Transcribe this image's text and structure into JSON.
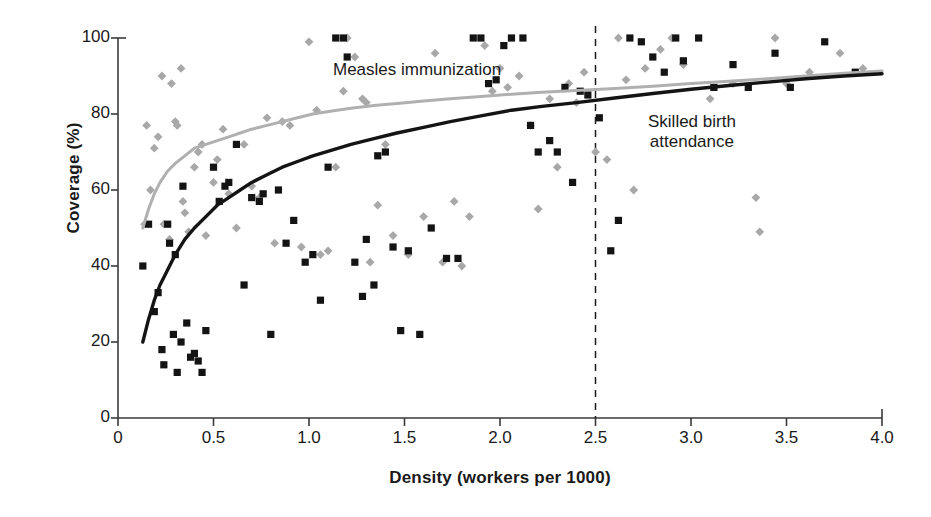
{
  "chart_data": {
    "type": "scatter",
    "title": "",
    "xlabel": "Density (workers per 1000)",
    "ylabel": "Coverage (%)",
    "xlim": [
      0,
      4.0
    ],
    "ylim": [
      0,
      100
    ],
    "xticks": [
      "0",
      "0.5",
      "1.0",
      "1.5",
      "2.0",
      "2.5",
      "3.0",
      "3.5",
      "4.0"
    ],
    "xtick_values": [
      0,
      0.5,
      1.0,
      1.5,
      2.0,
      2.5,
      3.0,
      3.5,
      4.0
    ],
    "yticks": [
      "0",
      "20",
      "40",
      "60",
      "80",
      "100"
    ],
    "ytick_values": [
      0,
      20,
      40,
      60,
      80,
      100
    ],
    "grid": false,
    "legend_position": "inline-annotations",
    "annotations": [
      {
        "text": "Measles immunization",
        "x": 1.15,
        "y": 88
      },
      {
        "text": "Skilled birth attendance",
        "x": 2.82,
        "y": 76
      }
    ],
    "reference_lines": [
      {
        "orientation": "vertical",
        "value": 2.5,
        "style": "dashed",
        "color": "#1a1a1a"
      }
    ],
    "series": [
      {
        "name": "Measles immunization",
        "marker": "diamond",
        "color": "#a8a8a8",
        "points": [
          [
            0.14,
            51
          ],
          [
            0.15,
            77
          ],
          [
            0.17,
            60
          ],
          [
            0.19,
            71
          ],
          [
            0.21,
            74
          ],
          [
            0.23,
            90
          ],
          [
            0.24,
            51
          ],
          [
            0.27,
            47
          ],
          [
            0.28,
            88
          ],
          [
            0.3,
            78
          ],
          [
            0.31,
            77
          ],
          [
            0.33,
            92
          ],
          [
            0.34,
            57
          ],
          [
            0.35,
            54
          ],
          [
            0.37,
            49
          ],
          [
            0.4,
            66
          ],
          [
            0.42,
            70
          ],
          [
            0.44,
            72
          ],
          [
            0.46,
            48
          ],
          [
            0.5,
            62
          ],
          [
            0.52,
            68
          ],
          [
            0.55,
            76
          ],
          [
            0.58,
            59
          ],
          [
            0.62,
            50
          ],
          [
            0.66,
            72
          ],
          [
            0.7,
            61
          ],
          [
            0.74,
            58
          ],
          [
            0.78,
            79
          ],
          [
            0.82,
            46
          ],
          [
            0.86,
            78
          ],
          [
            0.9,
            77
          ],
          [
            0.96,
            45
          ],
          [
            1.0,
            99
          ],
          [
            1.04,
            81
          ],
          [
            1.06,
            43
          ],
          [
            1.1,
            44
          ],
          [
            1.14,
            66
          ],
          [
            1.18,
            86
          ],
          [
            1.2,
            100
          ],
          [
            1.24,
            95
          ],
          [
            1.28,
            84
          ],
          [
            1.3,
            83
          ],
          [
            1.32,
            41
          ],
          [
            1.36,
            56
          ],
          [
            1.4,
            72
          ],
          [
            1.44,
            48
          ],
          [
            1.52,
            43
          ],
          [
            1.6,
            53
          ],
          [
            1.66,
            96
          ],
          [
            1.7,
            41
          ],
          [
            1.76,
            57
          ],
          [
            1.8,
            40
          ],
          [
            1.84,
            53
          ],
          [
            1.92,
            98
          ],
          [
            1.96,
            86
          ],
          [
            2.0,
            92
          ],
          [
            2.04,
            87
          ],
          [
            2.1,
            90
          ],
          [
            2.16,
            77
          ],
          [
            2.2,
            55
          ],
          [
            2.26,
            84
          ],
          [
            2.3,
            66
          ],
          [
            2.36,
            88
          ],
          [
            2.4,
            83
          ],
          [
            2.44,
            91
          ],
          [
            2.5,
            70
          ],
          [
            2.56,
            68
          ],
          [
            2.62,
            100
          ],
          [
            2.66,
            89
          ],
          [
            2.7,
            60
          ],
          [
            2.76,
            92
          ],
          [
            2.84,
            97
          ],
          [
            2.9,
            100
          ],
          [
            2.96,
            93
          ],
          [
            3.1,
            84
          ],
          [
            3.22,
            88
          ],
          [
            3.34,
            58
          ],
          [
            3.36,
            49
          ],
          [
            3.44,
            100
          ],
          [
            3.5,
            88
          ],
          [
            3.62,
            91
          ],
          [
            3.78,
            96
          ],
          [
            3.9,
            92
          ]
        ]
      },
      {
        "name": "Skilled birth attendance",
        "marker": "square",
        "color": "#141414",
        "points": [
          [
            0.13,
            40
          ],
          [
            0.16,
            51
          ],
          [
            0.19,
            28
          ],
          [
            0.21,
            33
          ],
          [
            0.23,
            18
          ],
          [
            0.24,
            14
          ],
          [
            0.26,
            51
          ],
          [
            0.27,
            46
          ],
          [
            0.29,
            22
          ],
          [
            0.3,
            43
          ],
          [
            0.31,
            12
          ],
          [
            0.33,
            20
          ],
          [
            0.34,
            61
          ],
          [
            0.36,
            25
          ],
          [
            0.38,
            16
          ],
          [
            0.4,
            17
          ],
          [
            0.42,
            15
          ],
          [
            0.44,
            12
          ],
          [
            0.46,
            23
          ],
          [
            0.5,
            66
          ],
          [
            0.53,
            57
          ],
          [
            0.56,
            61
          ],
          [
            0.58,
            62
          ],
          [
            0.62,
            72
          ],
          [
            0.66,
            35
          ],
          [
            0.7,
            58
          ],
          [
            0.74,
            57
          ],
          [
            0.76,
            59
          ],
          [
            0.8,
            22
          ],
          [
            0.84,
            60
          ],
          [
            0.88,
            46
          ],
          [
            0.92,
            52
          ],
          [
            0.98,
            41
          ],
          [
            1.02,
            43
          ],
          [
            1.06,
            31
          ],
          [
            1.1,
            66
          ],
          [
            1.14,
            100
          ],
          [
            1.18,
            100
          ],
          [
            1.2,
            95
          ],
          [
            1.24,
            41
          ],
          [
            1.28,
            32
          ],
          [
            1.3,
            47
          ],
          [
            1.34,
            35
          ],
          [
            1.36,
            69
          ],
          [
            1.4,
            70
          ],
          [
            1.44,
            45
          ],
          [
            1.48,
            23
          ],
          [
            1.52,
            44
          ],
          [
            1.58,
            22
          ],
          [
            1.64,
            50
          ],
          [
            1.72,
            42
          ],
          [
            1.78,
            42
          ],
          [
            1.86,
            100
          ],
          [
            1.9,
            100
          ],
          [
            1.94,
            88
          ],
          [
            1.98,
            89
          ],
          [
            2.02,
            98
          ],
          [
            2.06,
            100
          ],
          [
            2.12,
            100
          ],
          [
            2.16,
            77
          ],
          [
            2.2,
            70
          ],
          [
            2.26,
            73
          ],
          [
            2.3,
            70
          ],
          [
            2.34,
            87
          ],
          [
            2.38,
            62
          ],
          [
            2.42,
            86
          ],
          [
            2.46,
            85
          ],
          [
            2.52,
            79
          ],
          [
            2.58,
            44
          ],
          [
            2.62,
            52
          ],
          [
            2.68,
            100
          ],
          [
            2.74,
            99
          ],
          [
            2.8,
            95
          ],
          [
            2.86,
            91
          ],
          [
            2.92,
            100
          ],
          [
            2.96,
            94
          ],
          [
            3.04,
            100
          ],
          [
            3.12,
            87
          ],
          [
            3.22,
            93
          ],
          [
            3.3,
            87
          ],
          [
            3.44,
            96
          ],
          [
            3.52,
            87
          ],
          [
            3.7,
            99
          ],
          [
            3.86,
            91
          ]
        ]
      }
    ],
    "fitted_curves": [
      {
        "name": "Measles immunization",
        "color": "#b0b0b0",
        "points": [
          [
            0.13,
            50
          ],
          [
            0.16,
            55
          ],
          [
            0.19,
            59
          ],
          [
            0.22,
            62
          ],
          [
            0.26,
            65
          ],
          [
            0.3,
            67
          ],
          [
            0.35,
            69
          ],
          [
            0.4,
            71
          ],
          [
            0.46,
            72
          ],
          [
            0.52,
            73
          ],
          [
            0.58,
            74
          ],
          [
            0.64,
            75
          ],
          [
            0.7,
            76
          ],
          [
            0.78,
            77
          ],
          [
            0.86,
            78
          ],
          [
            0.94,
            79
          ],
          [
            1.02,
            80
          ],
          [
            1.12,
            80.8
          ],
          [
            1.22,
            81.5
          ],
          [
            1.34,
            82.2
          ],
          [
            1.46,
            82.8
          ],
          [
            1.6,
            83.4
          ],
          [
            1.74,
            84
          ],
          [
            1.9,
            84.6
          ],
          [
            2.06,
            85.2
          ],
          [
            2.22,
            85.7
          ],
          [
            2.4,
            86.2
          ],
          [
            2.6,
            86.7
          ],
          [
            2.8,
            87.3
          ],
          [
            3.0,
            88
          ],
          [
            3.2,
            88.6
          ],
          [
            3.4,
            89.3
          ],
          [
            3.6,
            90
          ],
          [
            3.8,
            90.7
          ],
          [
            4.0,
            91.3
          ]
        ]
      },
      {
        "name": "Skilled birth attendance",
        "color": "#141414",
        "points": [
          [
            0.13,
            20
          ],
          [
            0.16,
            26
          ],
          [
            0.19,
            31
          ],
          [
            0.22,
            35
          ],
          [
            0.26,
            39
          ],
          [
            0.3,
            43
          ],
          [
            0.35,
            47
          ],
          [
            0.4,
            50
          ],
          [
            0.46,
            53
          ],
          [
            0.52,
            56
          ],
          [
            0.58,
            58
          ],
          [
            0.64,
            60
          ],
          [
            0.7,
            62
          ],
          [
            0.78,
            64
          ],
          [
            0.86,
            66
          ],
          [
            0.94,
            67.5
          ],
          [
            1.02,
            69
          ],
          [
            1.12,
            70.5
          ],
          [
            1.22,
            72
          ],
          [
            1.34,
            73.5
          ],
          [
            1.46,
            75
          ],
          [
            1.6,
            76.5
          ],
          [
            1.74,
            78
          ],
          [
            1.9,
            79.5
          ],
          [
            2.06,
            81
          ],
          [
            2.22,
            82
          ],
          [
            2.4,
            83
          ],
          [
            2.6,
            84.2
          ],
          [
            2.8,
            85.4
          ],
          [
            3.0,
            86.5
          ],
          [
            3.2,
            87.5
          ],
          [
            3.4,
            88.4
          ],
          [
            3.6,
            89.3
          ],
          [
            3.8,
            90
          ],
          [
            4.0,
            90.6
          ]
        ]
      }
    ]
  },
  "axes": {
    "x_label": "Density (workers per 1000)",
    "y_label": "Coverage (%)"
  },
  "labels": {
    "measles": "Measles immunization",
    "skilled_birth_line1": "Skilled birth",
    "skilled_birth_line2": "attendance"
  },
  "colors": {
    "axis": "#3a3a3a",
    "series_black": "#141414",
    "series_gray": "#a8a8a8",
    "curve_gray": "#b0b0b0",
    "text": "#1a1a1a"
  }
}
